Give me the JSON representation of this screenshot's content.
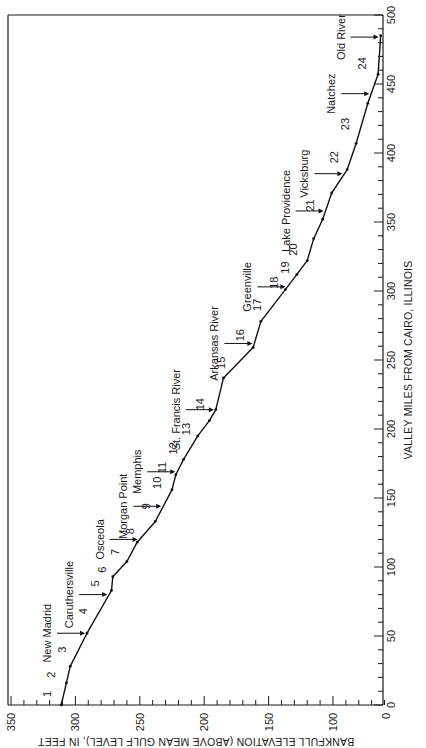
{
  "chart_data": {
    "type": "line",
    "orientation": "rotated-90-ccw",
    "title": "",
    "xlabel": "VALLEY MILES FROM CAIRO, ILLINOIS",
    "ylabel": "BANKFULL ELEVATION (ABOVE MEAN GULF LEVEL), IN FEET",
    "xlim": [
      0,
      500
    ],
    "ylim": [
      60,
      350
    ],
    "x_ticks": [
      0,
      50,
      100,
      150,
      200,
      250,
      300,
      350,
      400,
      450,
      500
    ],
    "y_ticks": [
      350,
      300,
      250,
      200,
      150,
      100
    ],
    "y_corner_label": "0",
    "grid": false,
    "legend": null,
    "series": [
      {
        "name": "Bankfull elevation profile",
        "x": [
          0,
          16,
          28,
          52,
          83,
          93,
          104,
          118,
          133,
          156,
          167,
          178,
          195,
          206,
          214,
          237,
          259,
          278,
          301,
          312,
          322,
          338,
          352,
          371,
          388,
          407,
          436,
          457,
          485
        ],
        "y": [
          311,
          307,
          304,
          291,
          272,
          271,
          260,
          252,
          238,
          225,
          222,
          216,
          205,
          196,
          191,
          185,
          162,
          156,
          137,
          128,
          120,
          115,
          108,
          101,
          89,
          82,
          73,
          65,
          63
        ]
      }
    ],
    "reach_labels": [
      {
        "label": "1",
        "mile": 8
      },
      {
        "label": "2",
        "mile": 22
      },
      {
        "label": "3",
        "mile": 40
      },
      {
        "label": "4",
        "mile": 68
      },
      {
        "label": "5",
        "mile": 88
      },
      {
        "label": "6",
        "mile": 98
      },
      {
        "label": "7",
        "mile": 111
      },
      {
        "label": "8",
        "mile": 126
      },
      {
        "label": "9",
        "mile": 144
      },
      {
        "label": "10",
        "mile": 161
      },
      {
        "label": "11",
        "mile": 172
      },
      {
        "label": "12",
        "mile": 186
      },
      {
        "label": "13",
        "mile": 200
      },
      {
        "label": "14",
        "mile": 218
      },
      {
        "label": "15",
        "mile": 248
      },
      {
        "label": "16",
        "mile": 268
      },
      {
        "label": "17",
        "mile": 290
      },
      {
        "label": "18",
        "mile": 306
      },
      {
        "label": "19",
        "mile": 317
      },
      {
        "label": "20",
        "mile": 330
      },
      {
        "label": "21",
        "mile": 362
      },
      {
        "label": "22",
        "mile": 397
      },
      {
        "label": "23",
        "mile": 421
      },
      {
        "label": "24",
        "mile": 465
      }
    ],
    "annotations": [
      {
        "label": "New Madrid",
        "mile": 52
      },
      {
        "label": "Caruthersville",
        "mile": 80
      },
      {
        "label": "Osceola",
        "mile": 120
      },
      {
        "label": "Morgan Point",
        "mile": 144
      },
      {
        "label": "Memphis",
        "mile": 169
      },
      {
        "label": "St. Francis River",
        "mile": 214
      },
      {
        "label": "Arkansas River",
        "mile": 262
      },
      {
        "label": "Greenville",
        "mile": 303
      },
      {
        "label": "Lake Providence",
        "mile": 358
      },
      {
        "label": "Vicksburg",
        "mile": 385
      },
      {
        "label": "Natchez",
        "mile": 443
      },
      {
        "label": "Old River",
        "mile": 484
      }
    ]
  }
}
